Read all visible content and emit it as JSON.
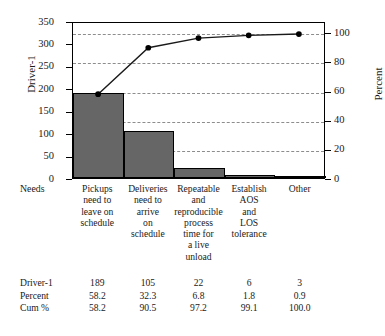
{
  "chart_data": {
    "type": "bar",
    "title": "",
    "subtitle": "",
    "categories": [
      "Pickups need to leave on schedule",
      "Deliveries need to arrive on schedule",
      "Repeatable and reproducible process time for a live unload",
      "Establish AOS and LOS tolerance",
      "Other"
    ],
    "series": [
      {
        "name": "Driver-1",
        "type": "bar",
        "values": [
          189,
          105,
          22,
          6,
          3
        ]
      },
      {
        "name": "Cum %",
        "type": "line",
        "values": [
          58.2,
          90.5,
          97.2,
          99.1,
          100.0
        ]
      }
    ],
    "percent": [
      58.2,
      32.3,
      6.8,
      1.8,
      0.9
    ],
    "xlabel": "Needs",
    "ylabel": "Driver-1",
    "y2label": "Percent",
    "ylim": [
      0,
      350
    ],
    "y2lim": [
      0,
      100
    ],
    "yticks": [
      0,
      50,
      100,
      150,
      200,
      250,
      300,
      350
    ],
    "y2ticks": [
      0,
      20,
      40,
      60,
      80,
      100
    ],
    "gridlines_at_percent": [
      20,
      40,
      60,
      80,
      100
    ],
    "grid": true,
    "legend": "none",
    "bar_color": "#666666",
    "bar_edge_color": "#000000",
    "line_color": "#1a1a1a",
    "marker_color": "#000000",
    "grid_color": "#8d8d8d"
  },
  "axes": {
    "left_title": "Driver-1",
    "right_title": "Percent",
    "corner_label": "Needs",
    "left_ticks": [
      "350",
      "300",
      "250",
      "200",
      "150",
      "100",
      "50",
      "0"
    ],
    "right_ticks": [
      "100",
      "80",
      "60",
      "40",
      "20",
      "0"
    ]
  },
  "category_labels": [
    [
      "Pickups",
      "need to",
      "leave on",
      "schedule"
    ],
    [
      "Deliveries",
      "need to",
      "arrive",
      "on",
      "schedule"
    ],
    [
      "Repeatable",
      "and",
      "reproducible",
      "process",
      "time for",
      "a live",
      "unload"
    ],
    [
      "Establish",
      "AOS",
      "and",
      "LOS",
      "tolerance"
    ],
    [
      "Other"
    ]
  ],
  "table": {
    "rows": [
      {
        "label": "Driver-1",
        "values": [
          "189",
          "105",
          "22",
          "6",
          "3"
        ]
      },
      {
        "label": "Percent",
        "values": [
          "58.2",
          "32.3",
          "6.8",
          "1.8",
          "0.9"
        ]
      },
      {
        "label": "Cum %",
        "values": [
          "58.2",
          "90.5",
          "97.2",
          "99.1",
          "100.0"
        ]
      }
    ]
  }
}
